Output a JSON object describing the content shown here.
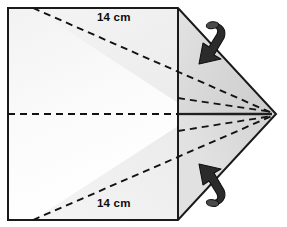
{
  "figure": {
    "kind": "geometry-net-diagram",
    "background_color": "#ffffff",
    "outline_color": "#1a1a1a",
    "fold_line_color": "#111111",
    "flap_fill_color": "#d6d6d6",
    "panel_fill_color": "#ffffff",
    "shade_fill_color": "#ededed",
    "arrow_color": "#262626",
    "labels": [
      {
        "id": "top",
        "text": "14 cm"
      },
      {
        "id": "bottom",
        "text": "14 cm"
      }
    ],
    "arrows": [
      {
        "id": "top-fold-arrow",
        "direction": "down-left"
      },
      {
        "id": "bottom-fold-arrow",
        "direction": "up-left"
      }
    ],
    "geometry": {
      "sheet_left_x": 8,
      "sheet_top_y": 8,
      "sheet_bottom_y": 220,
      "fold_line_x": 178,
      "apex_x": 276,
      "apex_y": 114,
      "midline_y": 114
    }
  }
}
